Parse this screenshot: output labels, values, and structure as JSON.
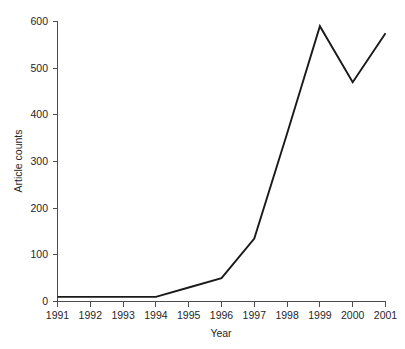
{
  "chart_data": {
    "type": "line",
    "title": "",
    "xlabel": "Year",
    "ylabel": "Article counts",
    "categories": [
      "1991",
      "1992",
      "1993",
      "1994",
      "1995",
      "1996",
      "1997",
      "1998",
      "1999",
      "2000",
      "2001"
    ],
    "x": [
      1991,
      1992,
      1993,
      1994,
      1995,
      1996,
      1997,
      1998,
      1999,
      2000,
      2001
    ],
    "values": [
      10,
      10,
      10,
      10,
      30,
      50,
      135,
      360,
      590,
      470,
      575
    ],
    "series": [
      {
        "name": "Article counts",
        "values": [
          10,
          10,
          10,
          10,
          30,
          50,
          135,
          360,
          590,
          470,
          575
        ],
        "color": "#1a1a1a"
      }
    ],
    "xlim": [
      1991,
      2001
    ],
    "ylim": [
      0,
      600
    ],
    "ytick_labels": [
      "0",
      "100",
      "200",
      "300",
      "400",
      "500",
      "600"
    ],
    "yticks": [
      0,
      100,
      200,
      300,
      400,
      500,
      600
    ],
    "xtick_labels": [
      "1991",
      "1992",
      "1993",
      "1994",
      "1995",
      "1996",
      "1997",
      "1998",
      "1999",
      "2000",
      "2001"
    ],
    "grid": false,
    "legend": false,
    "legend_position": "none",
    "background_color": "#ffffff",
    "axis_color": "#4d4d4d",
    "line_color": "#1a1a1a"
  }
}
